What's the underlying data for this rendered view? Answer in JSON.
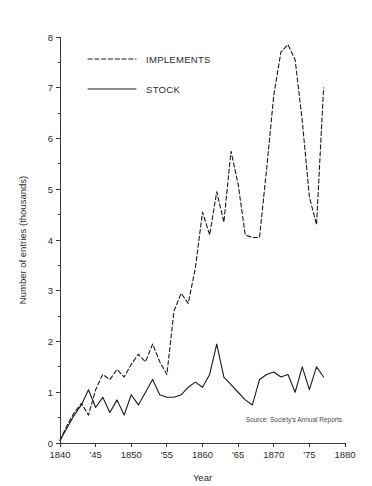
{
  "chart_data": {
    "type": "line",
    "title": "",
    "xlabel": "Year",
    "ylabel": "Number of entries (thousands)",
    "xlim": [
      1840,
      1880
    ],
    "ylim": [
      0,
      8
    ],
    "grid": false,
    "legend_position": "top-left",
    "x_tick_labels": [
      "1840",
      "'45",
      "1850",
      "'55",
      "1860",
      "'65",
      "1870",
      "'75",
      "1880"
    ],
    "x_tick_values": [
      1840,
      1845,
      1850,
      1855,
      1860,
      1865,
      1870,
      1875,
      1880
    ],
    "y_tick_labels": [
      "0",
      "1",
      "2",
      "3",
      "4",
      "5",
      "6",
      "7",
      "8"
    ],
    "y_tick_values": [
      0,
      1,
      2,
      3,
      4,
      5,
      6,
      7,
      8
    ],
    "y_minor_tick_values": [
      0.5,
      1.5,
      2.5,
      3.5,
      4.5,
      5.5,
      6.5,
      7.5
    ],
    "annotation": "Source: Society's Annual Reports",
    "series": [
      {
        "name": "IMPLEMENTS",
        "style": "dashed",
        "color": "#1a1a1a",
        "x": [
          1840,
          1841,
          1842,
          1843,
          1844,
          1845,
          1846,
          1847,
          1848,
          1849,
          1850,
          1851,
          1852,
          1853,
          1854,
          1855,
          1856,
          1857,
          1858,
          1859,
          1860,
          1861,
          1862,
          1863,
          1864,
          1865,
          1866,
          1867,
          1868,
          1869,
          1870,
          1871,
          1872,
          1873,
          1874,
          1875,
          1876,
          1877
        ],
        "values": [
          0.05,
          0.35,
          0.6,
          0.78,
          0.55,
          1.05,
          1.35,
          1.25,
          1.45,
          1.3,
          1.55,
          1.75,
          1.6,
          1.95,
          1.6,
          1.35,
          2.6,
          2.95,
          2.75,
          3.45,
          4.55,
          4.1,
          4.95,
          4.35,
          5.75,
          5.1,
          4.1,
          4.05,
          4.05,
          5.4,
          6.85,
          7.7,
          7.85,
          7.55,
          6.35,
          4.85,
          4.3,
          7.0
        ]
      },
      {
        "name": "STOCK",
        "style": "solid",
        "color": "#1a1a1a",
        "x": [
          1840,
          1841,
          1842,
          1843,
          1844,
          1845,
          1846,
          1847,
          1848,
          1849,
          1850,
          1851,
          1852,
          1853,
          1854,
          1855,
          1856,
          1857,
          1858,
          1859,
          1860,
          1861,
          1862,
          1863,
          1864,
          1865,
          1866,
          1867,
          1868,
          1869,
          1870,
          1871,
          1872,
          1873,
          1874,
          1875,
          1876,
          1877
        ],
        "values": [
          0.05,
          0.3,
          0.55,
          0.75,
          1.05,
          0.7,
          0.9,
          0.6,
          0.85,
          0.55,
          0.95,
          0.75,
          1.0,
          1.25,
          0.95,
          0.9,
          0.9,
          0.95,
          1.1,
          1.2,
          1.1,
          1.35,
          1.95,
          1.3,
          1.15,
          1.0,
          0.85,
          0.75,
          1.25,
          1.35,
          1.4,
          1.3,
          1.35,
          1.0,
          1.5,
          1.05,
          1.5,
          1.3
        ]
      }
    ]
  },
  "legend": {
    "items": [
      {
        "label": "IMPLEMENTS",
        "style": "dashed"
      },
      {
        "label": "STOCK",
        "style": "solid"
      }
    ]
  },
  "axes": {
    "y_title": "Number of entries (thousands)",
    "x_title": "Year"
  },
  "source": {
    "text": "Source: Society's Annual Reports"
  },
  "top_artifact": {
    "text": ""
  }
}
